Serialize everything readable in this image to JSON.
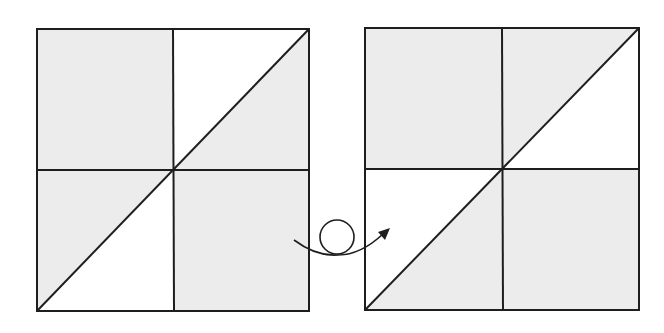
{
  "colors": {
    "background": "#ffffff",
    "shade": "#ececec",
    "line": "#1e1e1e"
  },
  "left_square": {
    "x": 37,
    "y": 29,
    "size": 272,
    "quadrants": {
      "top_left": "shaded",
      "top_right": "split-diagonal: upper-left white, lower-right shaded",
      "bottom_left": "split-diagonal: upper-left shaded, lower-right white",
      "bottom_right": "shaded"
    }
  },
  "right_square": {
    "x": 365,
    "y": 28,
    "size": 274,
    "quadrants": {
      "top_left": "shaded",
      "top_right": "split-diagonal: upper-left shaded, lower-right white",
      "bottom_left": "split-diagonal: upper-left white, lower-right shaded",
      "bottom_right": "shaded"
    }
  },
  "transform_arrow": {
    "description": "looped arrow indicating flip/rotation from left figure to right figure",
    "start": [
      294,
      240
    ],
    "end": [
      388,
      229
    ]
  }
}
